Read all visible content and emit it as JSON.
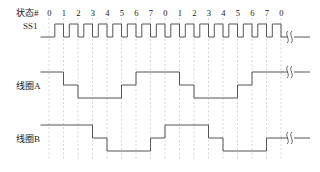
{
  "figure": {
    "type": "timing-diagram",
    "title": "",
    "background": "#ffffff",
    "trace_color": "#555555",
    "grid_color": "#bbbbbb",
    "text_color": "#1a1a1a"
  },
  "labels": {
    "state_row": "状态#",
    "ss1": "SS1",
    "coil_a": "线圈A",
    "coil_b": "线圈B"
  },
  "state_numbers": [
    "0",
    "1",
    "2",
    "3",
    "4",
    "5",
    "6",
    "7",
    "0",
    "1",
    "2",
    "3",
    "4",
    "5",
    "6",
    "7",
    "0"
  ],
  "chart_data": {
    "type": "line",
    "title": "",
    "xlabel": "",
    "ylabel": "",
    "grid": true,
    "legend_position": "left",
    "x_tick_labels": [
      "0",
      "1",
      "2",
      "3",
      "4",
      "5",
      "6",
      "7",
      "0",
      "1",
      "2",
      "3",
      "4",
      "5",
      "6",
      "7",
      "0"
    ],
    "series": [
      {
        "name": "SS1",
        "description": "clock pulse train, one pulse per state, logic high during second half of each state",
        "levels": [
          0,
          1
        ],
        "values": [
          0,
          1,
          0,
          1,
          0,
          1,
          0,
          1,
          0,
          1,
          0,
          1,
          0,
          1,
          0,
          1,
          0,
          1,
          0,
          1,
          0,
          1,
          0,
          1,
          0,
          1,
          0,
          1,
          0,
          1,
          0,
          1,
          0
        ]
      },
      {
        "name": "线圈A",
        "description": "three-level staircase, period 8 states",
        "levels": [
          -1,
          0,
          1
        ],
        "values": [
          1,
          0,
          -1,
          -1,
          -1,
          0,
          1,
          1,
          1,
          0,
          -1,
          -1,
          -1,
          0,
          1,
          1,
          1
        ]
      },
      {
        "name": "线圈B",
        "description": "three-level staircase, same as coil A shifted right by 2 states",
        "levels": [
          -1,
          0,
          1
        ],
        "values": [
          1,
          1,
          1,
          0,
          -1,
          -1,
          -1,
          0,
          1,
          1,
          1,
          0,
          -1,
          -1,
          -1,
          0,
          1
        ]
      }
    ]
  },
  "annotations": {
    "break_symbol": "break-mark",
    "break_count": 3
  }
}
